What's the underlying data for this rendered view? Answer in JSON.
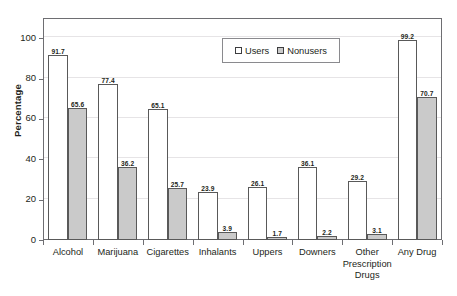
{
  "chart_data": {
    "type": "bar",
    "title": "",
    "xlabel": "",
    "ylabel": "Percentage",
    "ylim": [
      0,
      110
    ],
    "yticks": [
      0,
      20,
      40,
      60,
      80,
      100
    ],
    "ytick_labels": [
      "0",
      "20",
      "40",
      "60",
      "80",
      "100"
    ],
    "grid": true,
    "legend_position": "top-center",
    "categories": [
      "Alcohol",
      "Marijuana",
      "Cigarettes",
      "Inhalants",
      "Uppers",
      "Downers",
      "Other Prescription Drugs",
      "Any Drug"
    ],
    "category_lines": [
      [
        "Alcohol"
      ],
      [
        "Marijuana"
      ],
      [
        "Cigarettes"
      ],
      [
        "Inhalants"
      ],
      [
        "Uppers"
      ],
      [
        "Downers"
      ],
      [
        "Other",
        "Prescription",
        "Drugs"
      ],
      [
        "Any Drug"
      ]
    ],
    "series": [
      {
        "name": "Users",
        "color": "#ffffff",
        "values": [
          91.7,
          77.4,
          65.1,
          23.9,
          26.1,
          36.1,
          29.2,
          99.2
        ],
        "labels": [
          "91.7",
          "77.4",
          "65.1",
          "23.9",
          "26.1",
          "36.1",
          "29.2",
          "99.2"
        ]
      },
      {
        "name": "Nonusers",
        "color": "#cacaca",
        "values": [
          65.6,
          36.2,
          25.7,
          3.9,
          1.7,
          2.2,
          3.1,
          70.7
        ],
        "labels": [
          "65.6",
          "36.2",
          "25.7",
          "3.9",
          "1.7",
          "2.2",
          "3.1",
          "70.7"
        ]
      }
    ]
  },
  "legend": {
    "items": [
      {
        "label": "Users",
        "swatch": "users"
      },
      {
        "label": "Nonusers",
        "swatch": "nonusers"
      }
    ]
  },
  "colors": {
    "users_fill": "#ffffff",
    "nonusers_fill": "#cacaca",
    "bar_border": "#595959",
    "frame": "#6e6e72",
    "grid": "#e6e4e6",
    "text": "#231f20"
  }
}
